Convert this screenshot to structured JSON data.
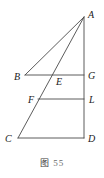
{
  "figure": {
    "caption_label": "图",
    "caption_number": "55",
    "caption_full": "图 55",
    "background_color": "#ffffff",
    "stroke_color": "#4a4a4a",
    "label_color": "#1a1a1a"
  },
  "diagram": {
    "type": "geometry",
    "points": [
      {
        "name": "A",
        "x": 84,
        "y": 17,
        "label": "A",
        "label_x": 88,
        "label_y": 14
      },
      {
        "name": "B",
        "x": 25,
        "y": 75,
        "label": "B",
        "label_x": 14,
        "label_y": 79
      },
      {
        "name": "C",
        "x": 18,
        "y": 138,
        "label": "C",
        "label_x": 6,
        "label_y": 140
      },
      {
        "name": "D",
        "x": 84,
        "y": 138,
        "label": "D",
        "label_x": 88,
        "label_y": 140
      },
      {
        "name": "E",
        "x": 55,
        "y": 75,
        "label": "E",
        "label_x": 57,
        "label_y": 84
      },
      {
        "name": "F",
        "x": 38,
        "y": 99,
        "label": "F",
        "label_x": 29,
        "label_y": 102
      },
      {
        "name": "G",
        "x": 84,
        "y": 75,
        "label": "G",
        "label_x": 88,
        "label_y": 78
      },
      {
        "name": "L",
        "x": 84,
        "y": 99,
        "label": "L",
        "label_x": 89,
        "label_y": 101
      }
    ],
    "segments": [
      {
        "name": "segment-AB",
        "from": "A",
        "to": "B"
      },
      {
        "name": "segment-AC",
        "from": "A",
        "to": "C"
      },
      {
        "name": "segment-AD",
        "from": "A",
        "to": "D"
      },
      {
        "name": "segment-CD",
        "from": "C",
        "to": "D"
      },
      {
        "name": "segment-BG",
        "from": "B",
        "to": "G"
      },
      {
        "name": "segment-FL",
        "from": "F",
        "to": "L"
      }
    ],
    "labels": [
      "A",
      "B",
      "C",
      "D",
      "E",
      "F",
      "G",
      "L"
    ]
  }
}
